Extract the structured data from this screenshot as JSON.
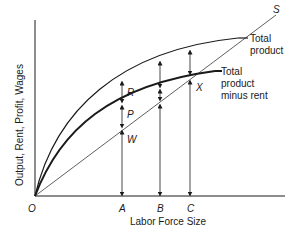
{
  "diagram": {
    "axes": {
      "ylabel": "Output, Rent, Profit, Wages",
      "xlabel": "Labor Force Size",
      "origin_label": "O"
    },
    "x_points": [
      {
        "label": "A",
        "x": 122
      },
      {
        "label": "B",
        "x": 160
      },
      {
        "label": "C",
        "x": 190
      }
    ],
    "line_s": {
      "label": "S"
    },
    "curves": {
      "total_product": {
        "line1": "Total",
        "line2": "product"
      },
      "total_product_minus_rent": {
        "line1": "Total",
        "line2": "product",
        "line3": "minus rent"
      }
    },
    "segment_labels": {
      "rent": "R",
      "profit": "P",
      "wages": "W",
      "intersection": "X"
    },
    "colors": {
      "ink": "#1a1a1a",
      "background": "#ffffff"
    }
  }
}
